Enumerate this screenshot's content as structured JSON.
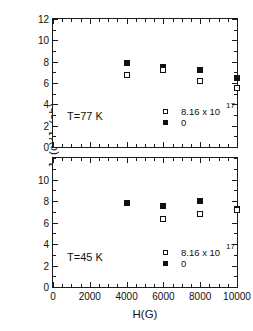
{
  "figure": {
    "ylabel": "J",
    "ylabel_sub1": "c",
    "ylabel_mid": " (c)/J",
    "ylabel_sub2": "c",
    "ylabel_end": " (ab)",
    "xlabel": "H(G)"
  },
  "legend": {
    "open_label": "8.16 x 10",
    "open_exponent": "17",
    "filled_label": "0"
  },
  "chart_data": [
    {
      "type": "scatter",
      "title": "",
      "annotation": "T=77 K",
      "xlabel": "H(G)",
      "ylabel": "Jc (c)/Jc (ab)",
      "xlim": [
        0,
        10000
      ],
      "ylim": [
        0,
        12
      ],
      "xticks": [
        0,
        2000,
        4000,
        6000,
        8000,
        10000
      ],
      "xtick_labels": [
        "0",
        "2000",
        "4000",
        "6000",
        "8000",
        "10000"
      ],
      "yticks": [
        0,
        2,
        4,
        6,
        8,
        10,
        12
      ],
      "ytick_labels": [
        "0",
        "2",
        "4",
        "6",
        "8",
        "10",
        "12"
      ],
      "x_minor_interval": 500,
      "y_minor_interval": 1,
      "grid": false,
      "legend_position": "lower-right",
      "series": [
        {
          "name": "0",
          "marker": "filled-square",
          "x": [
            4000,
            6000,
            8000,
            10000
          ],
          "y": [
            7.9,
            7.5,
            7.25,
            6.5
          ]
        },
        {
          "name": "8.16 x 10^17",
          "marker": "open-square",
          "x": [
            4000,
            6000,
            8000,
            10000
          ],
          "y": [
            6.75,
            7.2,
            6.2,
            5.5
          ]
        }
      ]
    },
    {
      "type": "scatter",
      "title": "",
      "annotation": "T=45 K",
      "xlabel": "H(G)",
      "ylabel": "Jc (c)/Jc (ab)",
      "xlim": [
        0,
        10000
      ],
      "ylim": [
        0,
        12
      ],
      "xticks": [
        0,
        2000,
        4000,
        6000,
        8000,
        10000
      ],
      "xtick_labels": [
        "0",
        "2000",
        "4000",
        "6000",
        "8000",
        "10000"
      ],
      "yticks": [
        0,
        2,
        4,
        6,
        8,
        10
      ],
      "ytick_labels": [
        "0",
        "2",
        "4",
        "6",
        "8",
        "10"
      ],
      "x_minor_interval": 500,
      "y_minor_interval": 1,
      "grid": false,
      "legend_position": "lower-right",
      "series": [
        {
          "name": "0",
          "marker": "filled-square",
          "x": [
            4000,
            6000,
            8000,
            10000
          ],
          "y": [
            7.8,
            7.5,
            8.0,
            7.3
          ]
        },
        {
          "name": "8.16 x 10^17",
          "marker": "open-square",
          "x": [
            6000,
            8000,
            10000
          ],
          "y": [
            6.3,
            6.8,
            7.2
          ]
        }
      ]
    }
  ],
  "panels": {
    "top": {
      "temp": "T=77 K"
    },
    "bottom": {
      "temp": "T=45 K"
    }
  }
}
